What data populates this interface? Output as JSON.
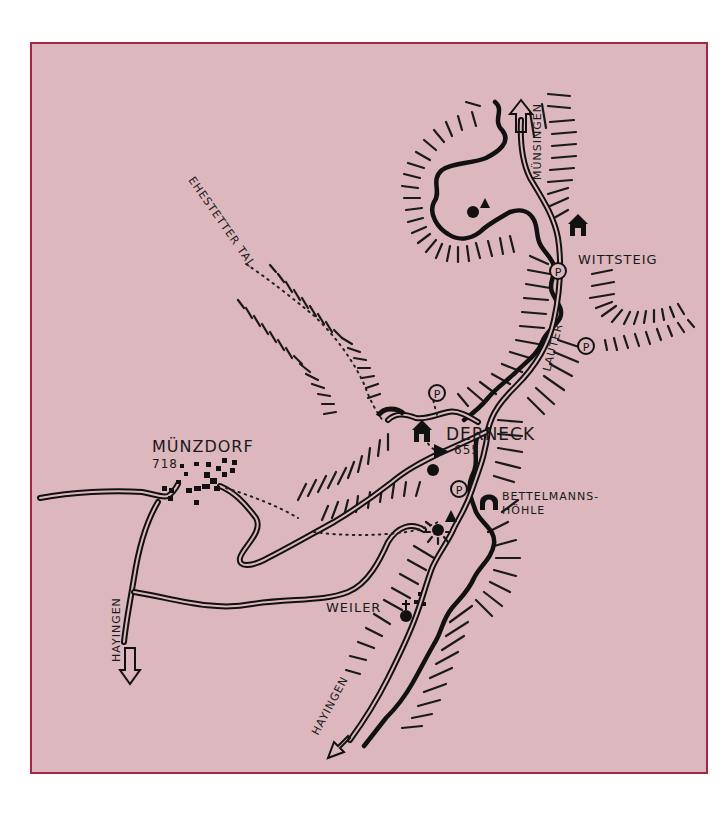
{
  "map": {
    "background_color": "#dcb7bd",
    "frame_color": "#a3283f",
    "ink_color": "#111111",
    "places": [
      {
        "id": "muenzdorf",
        "label": "MÜNZDORF",
        "elevation": "718"
      },
      {
        "id": "derneck",
        "label": "DERNECK",
        "elevation": "655"
      },
      {
        "id": "wittsteig",
        "label": "WITTSTEIG"
      },
      {
        "id": "weiler",
        "label": "WEILER"
      },
      {
        "id": "bettelmannshoehle",
        "label_line1": "BETTELMANNS-",
        "label_line2": "HÖHLE"
      }
    ],
    "valleys": [
      {
        "id": "ehestetter-tal",
        "label": "EHESTETTER TAL"
      }
    ],
    "rivers": [
      {
        "id": "lauter",
        "label": "LAUTER"
      }
    ],
    "directions": [
      {
        "id": "to-muensingen",
        "label": "MÜNSINGEN",
        "arrow": "up"
      },
      {
        "id": "to-hayingen-west",
        "label": "HAYINGEN",
        "arrow": "down"
      },
      {
        "id": "to-hayingen-south",
        "label": "HAYINGEN",
        "arrow": "down-left"
      }
    ],
    "symbols": {
      "parking": "P",
      "parking_count": 4,
      "hut_icon": "hut",
      "peak_icon": "triangle",
      "cave_icon": "cave",
      "church_icon": "cross"
    }
  }
}
